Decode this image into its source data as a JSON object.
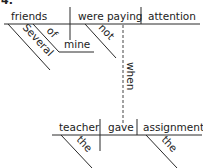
{
  "problem_number": "4.",
  "main_clause": {
    "subject": "friends",
    "verb": "were paying",
    "direct_object": "attention",
    "subject_modifiers": [
      "Several"
    ],
    "prepositional_phrase": {
      "preposition": "of",
      "object": "mine"
    },
    "verb_modifiers": [
      "not"
    ]
  },
  "connector": "when",
  "subordinate_clause": {
    "subject": "teacher",
    "verb": "gave",
    "direct_object": "assignment",
    "subject_modifiers": [
      "the"
    ],
    "object_modifiers": [
      "the"
    ]
  }
}
